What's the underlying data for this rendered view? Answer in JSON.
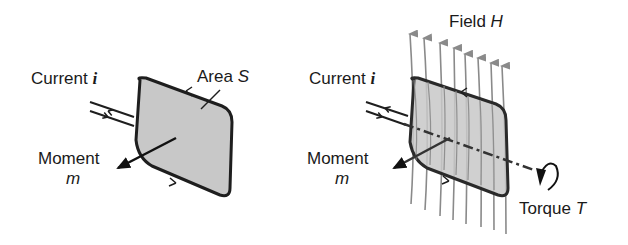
{
  "left_panel": {
    "current_label": "Current",
    "current_symbol": "i",
    "area_label": "Area",
    "area_symbol": "S",
    "moment_label": "Moment",
    "moment_symbol": "m"
  },
  "right_panel": {
    "current_label": "Current",
    "current_symbol": "i",
    "field_label": "Field",
    "field_symbol": "H",
    "moment_label": "Moment",
    "moment_symbol": "m",
    "torque_label": "Torque",
    "torque_symbol": "T",
    "field_line_count": 8
  },
  "colors": {
    "loop_fill": "#c8c8c8",
    "loop_stroke": "#1e1e1e",
    "field_lines": "#8a8a8a",
    "axis_line": "#333333",
    "text": "#1a1a1a"
  }
}
